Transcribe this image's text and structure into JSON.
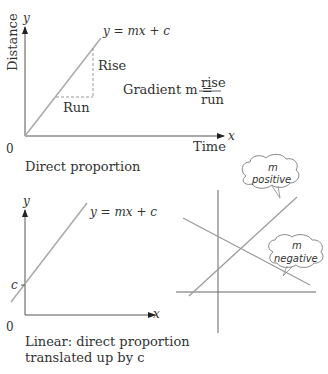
{
  "panel1": {
    "y_axis_var": "y",
    "x_axis_var": "x",
    "y_axis_label": "Distance",
    "x_axis_label": "Time",
    "origin_label": "0",
    "line_equation": "y = mx + c",
    "rise_label": "Rise",
    "run_label": "Run",
    "gradient_prefix": "Gradient m =",
    "gradient_numerator": "rise",
    "gradient_denominator": "run",
    "caption": "Direct proportion"
  },
  "panel2": {
    "y_axis_var": "y",
    "x_axis_var": "x",
    "origin_label": "0",
    "intercept_label": "c",
    "line_equation": "y = mx + c",
    "caption_line1": "Linear: direct proportion",
    "caption_line2": "translated up by c"
  },
  "panel3": {
    "positive_callout_line1": "m",
    "positive_callout_line2": "positive",
    "negative_callout_line1": "m",
    "negative_callout_line2": "negative"
  },
  "colors": {
    "line": "#aaaaaa",
    "axis": "#555555",
    "text": "#333333"
  }
}
